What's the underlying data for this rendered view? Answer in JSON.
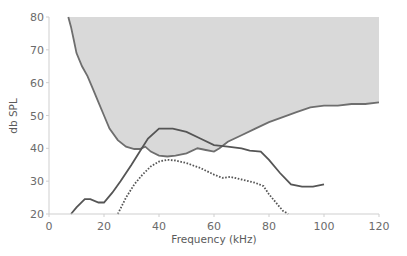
{
  "chart_data": {
    "type": "line",
    "title": "",
    "xlabel": "Frequency (kHz)",
    "ylabel": "db SPL",
    "xlim": [
      0,
      120
    ],
    "ylim": [
      20,
      80
    ],
    "xticks": [
      0,
      20,
      40,
      60,
      80,
      100,
      120
    ],
    "yticks": [
      20,
      30,
      40,
      50,
      60,
      70,
      80
    ],
    "grid": false,
    "legend": null,
    "series": [
      {
        "name": "threshold-shaded-region",
        "style": "solid-grey-boundary-filled-above",
        "color": "#6e6e6e",
        "fill": "#d9d9d9",
        "x": [
          7,
          8,
          9,
          10,
          12,
          14,
          16,
          18,
          20,
          22,
          25,
          28,
          31,
          33,
          35,
          37,
          40,
          43,
          46,
          50,
          54,
          57,
          60,
          62,
          65,
          70,
          75,
          80,
          85,
          90,
          95,
          100,
          105,
          110,
          115,
          120
        ],
        "y": [
          80,
          77,
          73,
          69,
          65,
          62,
          58,
          54,
          50,
          46,
          42.5,
          40.5,
          39.8,
          39.8,
          40.5,
          39,
          37.8,
          37.5,
          37.8,
          38.5,
          40,
          39.5,
          39,
          40,
          42,
          44,
          46,
          48,
          49.5,
          51,
          52.5,
          53,
          53,
          53.5,
          53.5,
          54
        ]
      },
      {
        "name": "solid-curve",
        "style": "solid",
        "color": "#555555",
        "x": [
          8,
          10,
          13,
          15,
          18,
          20,
          23,
          26,
          30,
          33,
          36,
          40,
          45,
          50,
          55,
          60,
          65,
          70,
          73,
          77,
          80,
          84,
          88,
          92,
          96,
          100
        ],
        "y": [
          20,
          22,
          24.5,
          24.5,
          23.5,
          23.5,
          26.5,
          30,
          35,
          39,
          43,
          46,
          46,
          45,
          43,
          41,
          40.5,
          40,
          39.3,
          39,
          36.5,
          32.5,
          29,
          28.3,
          28.3,
          29
        ]
      },
      {
        "name": "dotted-curve",
        "style": "dotted",
        "color": "#555555",
        "x": [
          25,
          28,
          31,
          34,
          37,
          40,
          43,
          46,
          50,
          55,
          60,
          63,
          66,
          70,
          75,
          78,
          80,
          83,
          85,
          87
        ],
        "y": [
          20,
          25,
          29,
          32,
          34.5,
          36,
          36.5,
          36.3,
          35.5,
          34,
          32,
          31,
          31.3,
          30.5,
          29.5,
          28.5,
          26,
          23,
          21,
          20
        ]
      }
    ]
  }
}
